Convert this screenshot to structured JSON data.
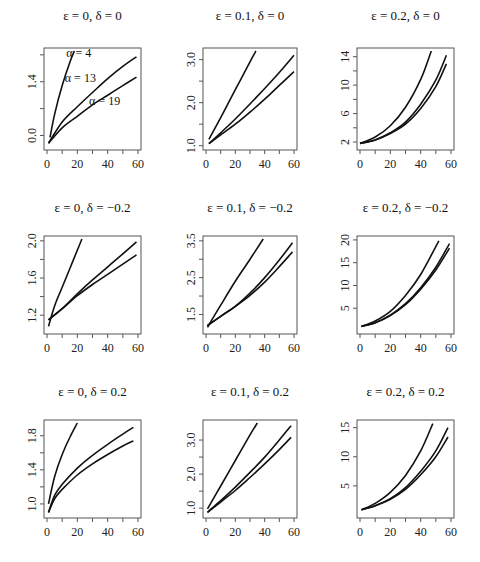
{
  "chart_data": [
    {
      "type": "line",
      "title": "ε = 0,    δ = 0",
      "xlabel": "",
      "ylabel": "",
      "xlim": [
        0,
        60
      ],
      "ylim": [
        -0.3,
        2.2
      ],
      "xticks": [
        0,
        20,
        40,
        60
      ],
      "xtick_labels": [
        "0",
        "20",
        "40",
        "60"
      ],
      "yticks": [
        0.0,
        0.7,
        1.4,
        2.1
      ],
      "ytick_labels": [
        "0.0",
        "",
        "1.4",
        ""
      ],
      "annotations": [
        {
          "text": "α = 4",
          "x": 21,
          "y": 2.05
        },
        {
          "text": "α = 13",
          "x": 22,
          "y": 1.4
        },
        {
          "text": "α = 19",
          "x": 38,
          "y": 0.8
        }
      ],
      "series": [
        {
          "name": "α = 4",
          "x": [
            2,
            5,
            10,
            15,
            18
          ],
          "y": [
            -0.05,
            0.55,
            1.3,
            1.9,
            2.2
          ]
        },
        {
          "name": "α = 13",
          "x": [
            1,
            10,
            20,
            30,
            40,
            50,
            59
          ],
          "y": [
            -0.2,
            0.35,
            0.75,
            1.12,
            1.48,
            1.8,
            2.05
          ]
        },
        {
          "name": "α = 19",
          "x": [
            1,
            10,
            20,
            30,
            40,
            50,
            59
          ],
          "y": [
            -0.2,
            0.2,
            0.5,
            0.8,
            1.05,
            1.3,
            1.52
          ]
        }
      ]
    },
    {
      "type": "line",
      "title": "ε = 0.1,    δ = 0",
      "xlabel": "",
      "ylabel": "",
      "xlim": [
        0,
        60
      ],
      "ylim": [
        0.97,
        3.2
      ],
      "xticks": [
        0,
        20,
        40,
        60
      ],
      "xtick_labels": [
        "0",
        "20",
        "40",
        "60"
      ],
      "yticks": [
        1.0,
        1.5,
        2.0,
        2.5,
        3.0
      ],
      "ytick_labels": [
        "1.0",
        "",
        "2.0",
        "",
        "3.0"
      ],
      "annotations": [],
      "series": [
        {
          "name": "α = 4",
          "x": [
            2,
            10,
            20,
            30,
            34
          ],
          "y": [
            1.15,
            1.65,
            2.3,
            2.95,
            3.2
          ]
        },
        {
          "name": "α = 13",
          "x": [
            2,
            10,
            20,
            30,
            40,
            50,
            60
          ],
          "y": [
            1.05,
            1.3,
            1.62,
            1.97,
            2.33,
            2.7,
            3.1
          ]
        },
        {
          "name": "α = 19",
          "x": [
            2,
            10,
            20,
            30,
            40,
            50,
            60
          ],
          "y": [
            1.05,
            1.25,
            1.5,
            1.78,
            2.08,
            2.4,
            2.72
          ]
        }
      ]
    },
    {
      "type": "line",
      "title": "ε = 0.2,    δ = 0",
      "xlabel": "",
      "ylabel": "",
      "xlim": [
        0,
        60
      ],
      "ylim": [
        1.3,
        14.8
      ],
      "xticks": [
        0,
        20,
        40,
        60
      ],
      "xtick_labels": [
        "0",
        "20",
        "40",
        "60"
      ],
      "yticks": [
        2,
        4,
        6,
        8,
        10,
        12,
        14
      ],
      "ytick_labels": [
        "2",
        "",
        "6",
        "",
        "10",
        "",
        "14"
      ],
      "annotations": [],
      "series": [
        {
          "name": "α = 4",
          "x": [
            0,
            10,
            20,
            30,
            40,
            47
          ],
          "y": [
            1.8,
            2.7,
            4.3,
            6.9,
            10.8,
            14.8
          ]
        },
        {
          "name": "α = 13",
          "x": [
            0,
            10,
            20,
            30,
            40,
            50,
            57
          ],
          "y": [
            1.8,
            2.3,
            3.3,
            4.8,
            7.3,
            10.7,
            14.2
          ]
        },
        {
          "name": "α = 19",
          "x": [
            0,
            10,
            20,
            30,
            40,
            50,
            57
          ],
          "y": [
            1.8,
            2.3,
            3.2,
            4.5,
            6.7,
            9.8,
            13.0
          ]
        }
      ]
    },
    {
      "type": "line",
      "title": "ε = 0,    δ = −0.2",
      "xlabel": "",
      "ylabel": "",
      "xlim": [
        0,
        60
      ],
      "ylim": [
        1.03,
        2.02
      ],
      "xticks": [
        0,
        20,
        40,
        60
      ],
      "xtick_labels": [
        "0",
        "20",
        "40",
        "60"
      ],
      "yticks": [
        1.2,
        1.4,
        1.6,
        1.8,
        2.0
      ],
      "ytick_labels": [
        "1.2",
        "",
        "1.6",
        "",
        "2.0"
      ],
      "annotations": [],
      "series": [
        {
          "name": "α = 4",
          "x": [
            1,
            5,
            10,
            15,
            20,
            23
          ],
          "y": [
            1.08,
            1.3,
            1.5,
            1.7,
            1.9,
            2.02
          ]
        },
        {
          "name": "α = 13",
          "x": [
            1,
            10,
            20,
            30,
            40,
            50,
            59
          ],
          "y": [
            1.15,
            1.27,
            1.43,
            1.58,
            1.72,
            1.86,
            1.99
          ]
        },
        {
          "name": "α = 19",
          "x": [
            1,
            10,
            20,
            30,
            40,
            50,
            59
          ],
          "y": [
            1.15,
            1.27,
            1.41,
            1.53,
            1.64,
            1.75,
            1.85
          ]
        }
      ]
    },
    {
      "type": "line",
      "title": "ε = 0.1,    δ = −0.2",
      "xlabel": "",
      "ylabel": "",
      "xlim": [
        0,
        60
      ],
      "ylim": [
        1.05,
        3.55
      ],
      "xticks": [
        0,
        20,
        40,
        60
      ],
      "xtick_labels": [
        "0",
        "20",
        "40",
        "60"
      ],
      "yticks": [
        1.5,
        2.0,
        2.5,
        3.0,
        3.5
      ],
      "ytick_labels": [
        "1.5",
        "",
        "2.5",
        "",
        "3.5"
      ],
      "annotations": [],
      "series": [
        {
          "name": "α = 4",
          "x": [
            1,
            10,
            20,
            30,
            39
          ],
          "y": [
            1.15,
            1.75,
            2.4,
            3.0,
            3.55
          ]
        },
        {
          "name": "α = 13",
          "x": [
            1,
            10,
            20,
            30,
            40,
            50,
            59
          ],
          "y": [
            1.2,
            1.45,
            1.72,
            2.08,
            2.5,
            2.98,
            3.45
          ]
        },
        {
          "name": "α = 19",
          "x": [
            1,
            10,
            20,
            30,
            40,
            50,
            59
          ],
          "y": [
            1.2,
            1.45,
            1.72,
            2.02,
            2.38,
            2.8,
            3.2
          ]
        }
      ]
    },
    {
      "type": "line",
      "title": "ε = 0.2,    δ = −0.2",
      "xlabel": "",
      "ylabel": "",
      "xlim": [
        0,
        60
      ],
      "ylim": [
        0,
        20.2
      ],
      "xticks": [
        0,
        20,
        40,
        60
      ],
      "xtick_labels": [
        "0",
        "20",
        "40",
        "60"
      ],
      "yticks": [
        5,
        10,
        15,
        20
      ],
      "ytick_labels": [
        "5",
        "10",
        "15",
        "20"
      ],
      "annotations": [],
      "series": [
        {
          "name": "α = 4",
          "x": [
            1,
            10,
            20,
            30,
            40,
            52
          ],
          "y": [
            1.0,
            2.2,
            4.3,
            7.8,
            12.4,
            19.8
          ]
        },
        {
          "name": "α = 13",
          "x": [
            1,
            10,
            20,
            30,
            40,
            50,
            59
          ],
          "y": [
            1.0,
            1.8,
            3.5,
            6.0,
            9.5,
            14.0,
            19.2
          ]
        },
        {
          "name": "α = 19",
          "x": [
            1,
            10,
            20,
            30,
            40,
            50,
            59
          ],
          "y": [
            1.0,
            1.8,
            3.4,
            5.8,
            9.2,
            13.4,
            18.2
          ]
        }
      ]
    },
    {
      "type": "line",
      "title": "ε = 0,    δ = 0.2",
      "xlabel": "",
      "ylabel": "",
      "xlim": [
        0,
        60
      ],
      "ylim": [
        0.87,
        1.95
      ],
      "xticks": [
        0,
        20,
        40,
        60
      ],
      "xtick_labels": [
        "0",
        "20",
        "40",
        "60"
      ],
      "yticks": [
        1.0,
        1.2,
        1.4,
        1.6,
        1.8
      ],
      "ytick_labels": [
        "1.0",
        "",
        "1.4",
        "",
        "1.8"
      ],
      "annotations": [],
      "series": [
        {
          "name": "α = 4",
          "x": [
            1,
            5,
            10,
            15,
            20
          ],
          "y": [
            1.0,
            1.32,
            1.58,
            1.78,
            1.95
          ]
        },
        {
          "name": "α = 13",
          "x": [
            1,
            5,
            10,
            20,
            30,
            40,
            50,
            57
          ],
          "y": [
            0.9,
            1.1,
            1.23,
            1.42,
            1.57,
            1.7,
            1.82,
            1.9
          ]
        },
        {
          "name": "α = 19",
          "x": [
            1,
            5,
            10,
            20,
            30,
            40,
            50,
            57
          ],
          "y": [
            0.9,
            1.06,
            1.17,
            1.34,
            1.47,
            1.58,
            1.68,
            1.74
          ]
        }
      ]
    },
    {
      "type": "line",
      "title": "ε = 0.1,    δ = 0.2",
      "xlabel": "",
      "ylabel": "",
      "xlim": [
        0,
        60
      ],
      "ylim": [
        0.8,
        3.5
      ],
      "xticks": [
        0,
        20,
        40,
        60
      ],
      "xtick_labels": [
        "0",
        "20",
        "40",
        "60"
      ],
      "yticks": [
        1.0,
        1.5,
        2.0,
        2.5,
        3.0
      ],
      "ytick_labels": [
        "1.0",
        "",
        "2.0",
        "",
        "3.0"
      ],
      "annotations": [],
      "series": [
        {
          "name": "α = 4",
          "x": [
            1,
            10,
            20,
            30,
            35
          ],
          "y": [
            0.98,
            1.65,
            2.4,
            3.15,
            3.5
          ]
        },
        {
          "name": "α = 13",
          "x": [
            1,
            10,
            20,
            30,
            40,
            50,
            58
          ],
          "y": [
            0.88,
            1.22,
            1.62,
            2.05,
            2.5,
            3.0,
            3.42
          ]
        },
        {
          "name": "α = 19",
          "x": [
            1,
            10,
            20,
            30,
            40,
            50,
            58
          ],
          "y": [
            0.88,
            1.18,
            1.52,
            1.9,
            2.3,
            2.72,
            3.08
          ]
        }
      ]
    },
    {
      "type": "line",
      "title": "ε = 0.2,    δ = 0.2",
      "xlabel": "",
      "ylabel": "",
      "xlim": [
        0,
        60
      ],
      "ylim": [
        0,
        15.8
      ],
      "xticks": [
        0,
        20,
        40,
        60
      ],
      "xtick_labels": [
        "0",
        "20",
        "40",
        "60"
      ],
      "yticks": [
        5,
        10,
        15
      ],
      "ytick_labels": [
        "5",
        "10",
        "15"
      ],
      "annotations": [],
      "series": [
        {
          "name": "α = 4",
          "x": [
            1,
            10,
            20,
            30,
            40,
            48
          ],
          "y": [
            0.9,
            2.0,
            3.9,
            6.8,
            11.0,
            15.7
          ]
        },
        {
          "name": "α = 13",
          "x": [
            1,
            10,
            20,
            30,
            40,
            50,
            58
          ],
          "y": [
            0.9,
            1.6,
            2.8,
            4.7,
            7.5,
            11.0,
            15.0
          ]
        },
        {
          "name": "α = 19",
          "x": [
            1,
            10,
            20,
            30,
            40,
            50,
            58
          ],
          "y": [
            0.9,
            1.6,
            2.7,
            4.4,
            6.9,
            10.0,
            13.4
          ]
        }
      ]
    }
  ],
  "layout": {
    "panels": [
      {
        "box": [
          44,
          48,
          97,
          102
        ],
        "title_y": 20
      },
      {
        "box": [
          203,
          48,
          94,
          102
        ],
        "title_y": 20
      },
      {
        "box": [
          357,
          48,
          97,
          102
        ],
        "title_y": 20
      },
      {
        "box": [
          44,
          236,
          97,
          98
        ],
        "title_y": 212
      },
      {
        "box": [
          203,
          236,
          94,
          98
        ],
        "title_y": 212
      },
      {
        "box": [
          357,
          236,
          97,
          98
        ],
        "title_y": 212
      },
      {
        "box": [
          44,
          420,
          97,
          98
        ],
        "title_y": 396
      },
      {
        "box": [
          203,
          420,
          94,
          98
        ],
        "title_y": 396
      },
      {
        "box": [
          357,
          420,
          97,
          98
        ],
        "title_y": 396
      }
    ]
  }
}
